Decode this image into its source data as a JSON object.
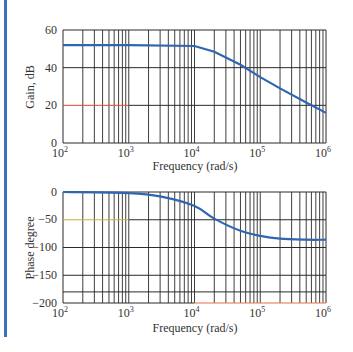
{
  "accent_colors": {
    "curve": "#2f66b0",
    "grid": "#2a2a2a",
    "highlight_20db": "#e0443c",
    "highlight_minus50": "#c9b03a",
    "highlight_bottom_axis": "#e8734a",
    "side_bar": "#3b72b8"
  },
  "chart_data": [
    {
      "type": "line",
      "title": "",
      "xlabel": "Frequency (rad/s)",
      "ylabel": "Gain, dB",
      "xscale": "log",
      "xlim": [
        100,
        1000000
      ],
      "ylim": [
        0,
        60
      ],
      "x_ticks": [
        "10^2",
        "10^3",
        "10^4",
        "10^5",
        "10^6"
      ],
      "y_ticks": [
        "0",
        "20",
        "40",
        "60"
      ],
      "grid": true,
      "series": [
        {
          "name": "Gain",
          "x": [
            100,
            1000,
            10000,
            20000,
            50000,
            100000,
            200000,
            500000,
            1000000
          ],
          "values": [
            52,
            52,
            51.5,
            48.5,
            41.5,
            35,
            29,
            21.5,
            16
          ]
        }
      ]
    },
    {
      "type": "line",
      "title": "",
      "xlabel": "Frequency (rad/s)",
      "ylabel": "Phase degree",
      "xscale": "log",
      "xlim": [
        100,
        1000000
      ],
      "ylim": [
        -200,
        0
      ],
      "x_ticks": [
        "10^2",
        "10^3",
        "10^4",
        "10^5",
        "10^6"
      ],
      "y_ticks": [
        "0",
        "-50",
        "-100",
        "-150",
        "-200"
      ],
      "grid": true,
      "series": [
        {
          "name": "Phase",
          "x": [
            100,
            1000,
            3000,
            10000,
            20000,
            50000,
            100000,
            200000,
            500000,
            1000000
          ],
          "values": [
            0,
            -2,
            -8,
            -25,
            -48,
            -70,
            -79,
            -84,
            -86,
            -86
          ]
        }
      ]
    }
  ],
  "labels": {
    "gain": {
      "ylabel": "Gain, dB",
      "xlabel": "Frequency (rad/s)",
      "yticks": [
        "60",
        "40",
        "20",
        "0"
      ]
    },
    "phase": {
      "ylabel": "Phase degree",
      "xlabel": "Frequency (rad/s)",
      "yticks": [
        "0",
        "−50",
        "−100",
        "−150",
        "−200"
      ]
    },
    "xticks": [
      {
        "base": "10",
        "exp": "2"
      },
      {
        "base": "10",
        "exp": "3"
      },
      {
        "base": "10",
        "exp": "4"
      },
      {
        "base": "10",
        "exp": "5"
      },
      {
        "base": "10",
        "exp": "6"
      }
    ]
  }
}
